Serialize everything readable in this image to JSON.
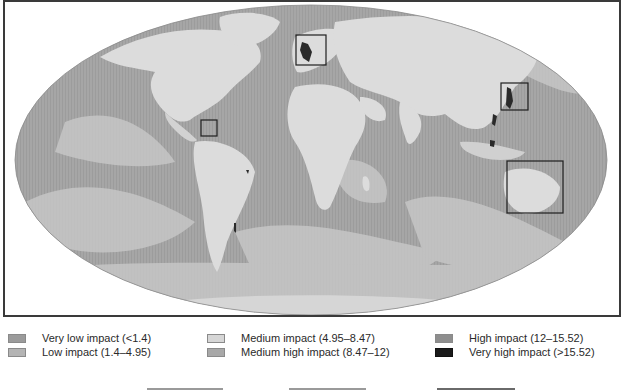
{
  "map": {
    "projection": "Mollweide",
    "background_color": "#ffffff",
    "ocean_base_color": "#a9a9a9",
    "land_color": "#dcdcdc",
    "highlight_boxes": [
      {
        "name": "north-sea-box",
        "x": 291,
        "y": 33,
        "w": 30,
        "h": 30
      },
      {
        "name": "caribbean-box",
        "x": 196,
        "y": 118,
        "w": 16,
        "h": 16
      },
      {
        "name": "east-asia-box",
        "x": 496,
        "y": 81,
        "w": 27,
        "h": 27
      },
      {
        "name": "coral-triangle-box",
        "x": 502,
        "y": 159,
        "w": 56,
        "h": 52
      }
    ]
  },
  "legend": {
    "items": [
      {
        "label": "Very low impact (<1.4)",
        "color": "#9b9b9b"
      },
      {
        "label": "Low impact (1.4–4.95)",
        "color": "#b4b4b4"
      },
      {
        "label": "Medium impact (4.95–8.47)",
        "color": "#d6d6d6"
      },
      {
        "label": "Medium high impact (8.47–12)",
        "color": "#a8a8a8"
      },
      {
        "label": "High impact (12–15.52)",
        "color": "#8e8e8e"
      },
      {
        "label": "Very high impact (>15.52)",
        "color": "#1a1a1a"
      }
    ]
  }
}
